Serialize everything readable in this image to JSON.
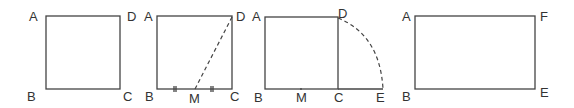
{
  "figures": [
    {
      "name": "square-abcd",
      "labels": {
        "A": "A",
        "B": "B",
        "C": "C",
        "D": "D"
      }
    },
    {
      "name": "square-with-midpoint",
      "labels": {
        "A": "A",
        "B": "B",
        "C": "C",
        "D": "D",
        "M": "M"
      }
    },
    {
      "name": "square-with-arc",
      "labels": {
        "A": "A",
        "B": "B",
        "C": "C",
        "D": "D",
        "M": "M",
        "E": "E"
      }
    },
    {
      "name": "golden-rectangle",
      "labels": {
        "A": "A",
        "B": "B",
        "E": "E",
        "F": "F"
      }
    }
  ],
  "colors": {
    "stroke": "#444444",
    "text": "#333333",
    "background": "#ffffff"
  }
}
